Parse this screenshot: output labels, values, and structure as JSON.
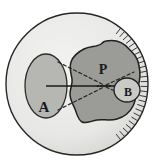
{
  "figure": {
    "labels": [
      {
        "id": "label-a",
        "text": "A",
        "x": 44,
        "y": 112,
        "size": 15
      },
      {
        "id": "label-p",
        "text": "P",
        "x": 103,
        "y": 74,
        "size": 14
      },
      {
        "id": "label-b",
        "text": "B",
        "x": 128,
        "y": 96,
        "size": 12
      }
    ],
    "colors": {
      "background": "#ffffff",
      "outer_circle_fill": "#e9e9e7",
      "outer_circle_stroke": "#262626",
      "ellipse_a_fill": "#b6b6b3",
      "ellipse_a_stroke": "#2b2b2b",
      "blob_fill": "#9b9b98",
      "blob_stroke": "#1f1f1f",
      "ellipse_b_fill": "#c9c9c6",
      "ellipse_b_stroke": "#1f1f1f",
      "line_solid": "#1a1a1a",
      "line_dashed": "#262626",
      "hatch": "#3a3a3a",
      "label_color": "#1a1a1a"
    },
    "shapes": {
      "outer_circle": {
        "cx": 77,
        "cy": 84,
        "r": 71
      },
      "ellipse_a": {
        "cx": 46,
        "cy": 86,
        "rx": 21,
        "ry": 32
      },
      "ellipse_b": {
        "cx": 127,
        "cy": 90,
        "rx": 13,
        "ry": 12
      },
      "point_p": {
        "cx": 105,
        "cy": 86
      },
      "blob_path": "M 106 41 C 116 39 124 43 129 49 C 134 54 138 58 139 66 C 141 74 140 80 138 87 C 136 94 136 100 133 106 C 130 112 124 117 117 119 C 110 121 103 119 97 120 C 91 121 86 124 82 122 C 78 120 77 114 75 109 C 73 104 70 100 70 94 C 70 88 73 84 72 79 C 71 73 69 68 71 62 C 73 56 78 52 84 49 C 90 46 97 47 101 44 C 103 42 104 41 106 41 Z"
    },
    "axis_line": {
      "x1": 46,
      "y1": 86,
      "x2": 140,
      "y2": 86
    },
    "dashed_rays": [
      {
        "id": "ray-upper",
        "x1": 58,
        "y1": 62,
        "x2": 104,
        "y2": 85
      },
      {
        "id": "ray-lower",
        "x1": 58,
        "y1": 110,
        "x2": 104,
        "y2": 87
      },
      {
        "id": "ray-upper-out",
        "x1": 106,
        "y1": 85,
        "x2": 134,
        "y2": 72
      },
      {
        "id": "ray-lower-out",
        "x1": 106,
        "y1": 87,
        "x2": 134,
        "y2": 100
      }
    ],
    "p_dots": [
      {
        "cx": 98,
        "cy": 86
      },
      {
        "cx": 101,
        "cy": 86
      },
      {
        "cx": 104,
        "cy": 86
      },
      {
        "cx": 107,
        "cy": 86
      },
      {
        "cx": 110,
        "cy": 86
      }
    ],
    "hatch_marks": {
      "count": 26,
      "arc_start_deg": -52,
      "arc_end_deg": 52,
      "inner_r": 64,
      "outer_r": 71
    }
  }
}
